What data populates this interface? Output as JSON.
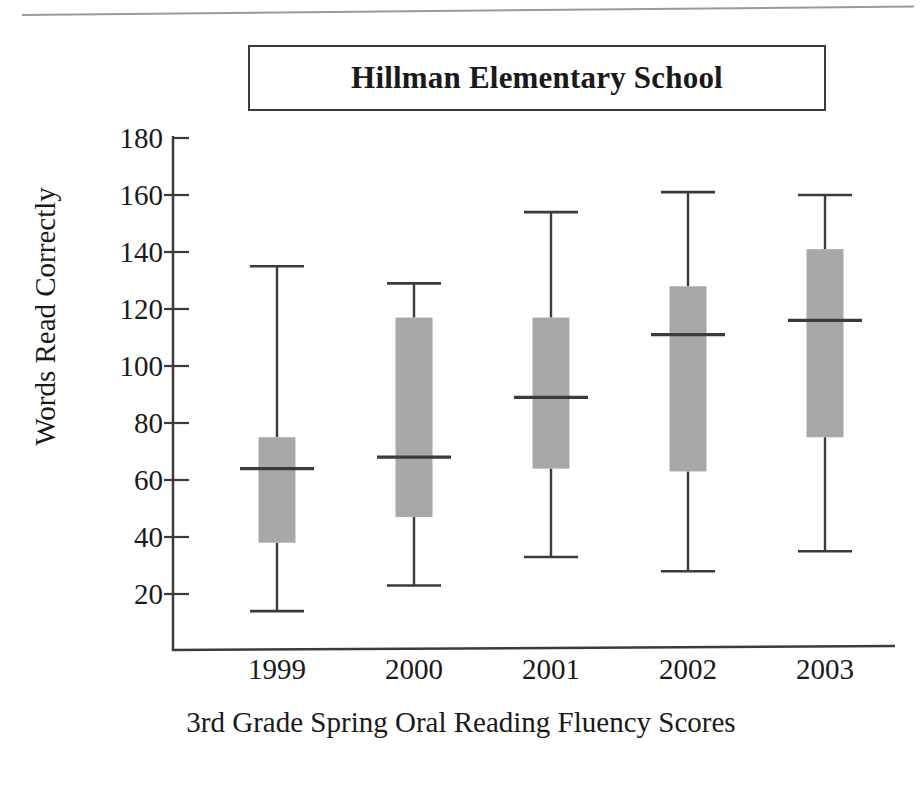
{
  "figure": {
    "title": "Hillman Elementary School",
    "y_axis_title": "Words Read Correctly",
    "x_axis_title": "3rd Grade Spring Oral Reading Fluency Scores",
    "box_fill_color": "#a8a8a8",
    "line_color": "#3b3b3b"
  },
  "chart_data": {
    "type": "box",
    "title": "Hillman Elementary School",
    "subtitle": "",
    "xlabel": "3rd Grade Spring Oral Reading Fluency Scores",
    "ylabel": "Words Read Correctly",
    "categories": [
      "1999",
      "2000",
      "2001",
      "2002",
      "2003"
    ],
    "ylim": [
      0,
      180
    ],
    "yticks": [
      20,
      40,
      60,
      80,
      100,
      120,
      140,
      160,
      180
    ],
    "ytick_labels": [
      "20",
      "40",
      "60",
      "80",
      "100",
      "120",
      "140",
      "160",
      "180"
    ],
    "grid": false,
    "legend": "none",
    "boxes": [
      {
        "category": "1999",
        "whisker_low": 14,
        "q1": 38,
        "median": 64,
        "q3": 75,
        "whisker_high": 135
      },
      {
        "category": "2000",
        "whisker_low": 23,
        "q1": 47,
        "median": 68,
        "q3": 117,
        "whisker_high": 129
      },
      {
        "category": "2001",
        "whisker_low": 33,
        "q1": 64,
        "median": 89,
        "q3": 117,
        "whisker_high": 154
      },
      {
        "category": "2002",
        "whisker_low": 28,
        "q1": 63,
        "median": 111,
        "q3": 128,
        "whisker_high": 161
      },
      {
        "category": "2003",
        "whisker_low": 35,
        "q1": 75,
        "median": 116,
        "q3": 141,
        "whisker_high": 160
      }
    ]
  }
}
